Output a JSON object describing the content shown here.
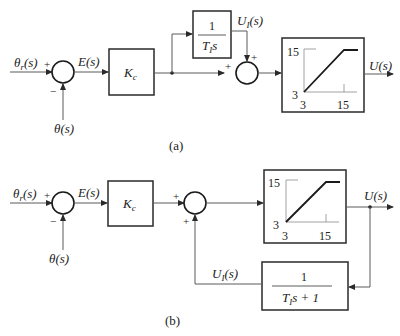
{
  "diagram_a": {
    "caption": "(a)",
    "input_label": "θr(s)",
    "input_main": "θ",
    "input_sub": "r",
    "input_suffix": "(s)",
    "feedback_label": "θ(s)",
    "sum1_signs": {
      "top": "+",
      "bottom": "−"
    },
    "error_label": "E(s)",
    "gain_main": "K",
    "gain_sub": "c",
    "integrator_num": "1",
    "integrator_den_main": "T",
    "integrator_den_sub": "I",
    "integrator_den_suffix": "s",
    "integral_out_main": "U",
    "integral_out_sub": "I",
    "integral_out_suffix": "(s)",
    "sum2_signs": {
      "left": "+",
      "top": "+"
    },
    "saturation": {
      "y_high": "15",
      "y_low": "3",
      "x_low": "3",
      "x_high": "15"
    },
    "output_label": "U(s)"
  },
  "diagram_b": {
    "caption": "(b)",
    "input_main": "θ",
    "input_sub": "r",
    "input_suffix": "(s)",
    "feedback_label": "θ(s)",
    "sum1_signs": {
      "top": "+",
      "bottom": "−"
    },
    "error_label": "E(s)",
    "gain_main": "K",
    "gain_sub": "c",
    "sum2_signs": {
      "left": "+",
      "bottom": "+"
    },
    "saturation": {
      "y_high": "15",
      "y_low": "3",
      "x_low": "3",
      "x_high": "15"
    },
    "output_label": "U(s)",
    "lag_num": "1",
    "lag_den_main": "T",
    "lag_den_sub": "I",
    "lag_den_suffix": "s + 1",
    "lag_out_main": "U",
    "lag_out_sub": "I",
    "lag_out_suffix": "(s)"
  }
}
